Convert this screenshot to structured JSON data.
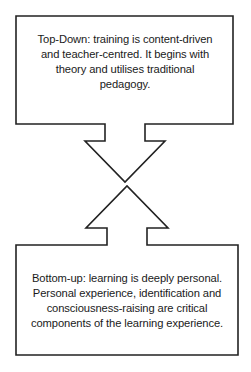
{
  "diagram": {
    "stroke_color": "#222222",
    "background": "#ffffff",
    "top_box": {
      "label": "Top-Down",
      "lines": [
        "Top-Down: training is content-driven",
        "and teacher-centred. It begins with",
        "theory and utilises traditional",
        "pedagogy."
      ]
    },
    "bottom_box": {
      "label": "Bottom-up",
      "lines": [
        "Bottom-up: learning is deeply personal.",
        "Personal experience, identification and",
        "consciousness-raising are critical",
        "components of the learning experience."
      ]
    },
    "arrows": [
      {
        "direction": "down",
        "from": "top_box"
      },
      {
        "direction": "up",
        "from": "bottom_box"
      }
    ]
  }
}
